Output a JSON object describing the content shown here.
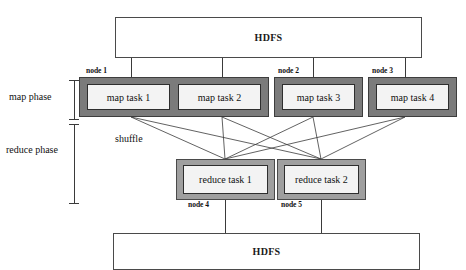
{
  "diagram": {
    "colors": {
      "map_node_fill": "#7b7b7b",
      "reduce_node_fill": "#9f9f9f",
      "task_fill": "#f3f3f3",
      "line": "#3a3a3a",
      "text": "#111111"
    },
    "storage": {
      "top": {
        "label": "HDFS"
      },
      "bottom": {
        "label": "HDFS"
      }
    },
    "phases": [
      {
        "key": "map",
        "label": "map phase"
      },
      {
        "key": "reduce",
        "label": "reduce phase"
      }
    ],
    "shuffle": {
      "label": "shuffle"
    },
    "map_nodes": [
      {
        "caption": "node 1",
        "tasks": [
          {
            "label": "map task 1"
          },
          {
            "label": "map task 2"
          }
        ]
      },
      {
        "caption": "node 2",
        "tasks": [
          {
            "label": "map task 3"
          }
        ]
      },
      {
        "caption": "node 3",
        "tasks": [
          {
            "label": "map task 4"
          }
        ]
      }
    ],
    "reduce_nodes": [
      {
        "caption": "node 4",
        "task": {
          "label": "reduce task 1"
        }
      },
      {
        "caption": "node 5",
        "task": {
          "label": "reduce task 2"
        }
      }
    ]
  }
}
